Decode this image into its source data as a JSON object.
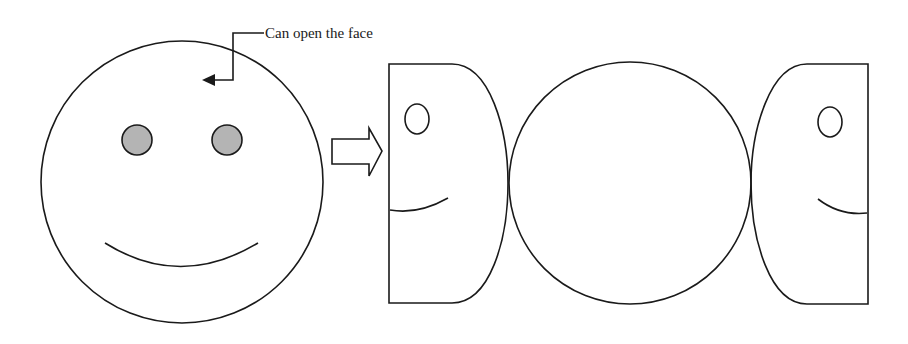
{
  "diagram": {
    "callout": {
      "text": "Can open the face"
    },
    "colors": {
      "stroke": "#1a1a1a",
      "eye_fill": "#b4b4b4",
      "background": "#ffffff"
    },
    "parts": [
      {
        "id": "whole-face",
        "description": "Closed smiley face with two gray eyes and a smile"
      },
      {
        "id": "transition-arrow",
        "description": "Hollow block arrow pointing right"
      },
      {
        "id": "left-half",
        "description": "Left opened half with eye and partial smile"
      },
      {
        "id": "center-circle",
        "description": "Inner circular panel"
      },
      {
        "id": "right-half",
        "description": "Right opened half with eye and partial smile"
      }
    ]
  }
}
